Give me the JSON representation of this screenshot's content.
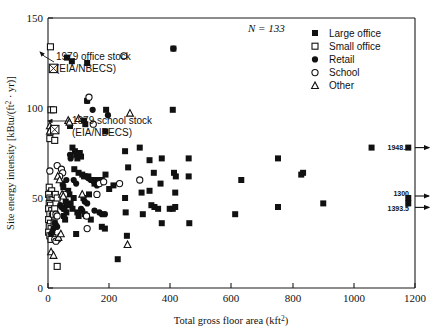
{
  "chart_data": {
    "type": "scatter",
    "title": "",
    "xlabel": "Total gross floor area (kft",
    "xlabel_sup": "2",
    "xlabel_tail": ")",
    "ylabel_a": "Site energy intensity [kBtu/(ft",
    "ylabel_sup": "2",
    "ylabel_b": " · yr)]",
    "xlim": [
      0,
      1200
    ],
    "ylim": [
      0,
      150
    ],
    "xticks": [
      0,
      200,
      400,
      600,
      800,
      1000,
      1200
    ],
    "yticks": [
      0,
      50,
      100,
      150
    ],
    "grid": false,
    "legend_position": "top-right",
    "n_label": "N = 133",
    "legend": [
      {
        "label": "Large office",
        "marker": "filled-square"
      },
      {
        "label": "Small office",
        "marker": "open-square"
      },
      {
        "label": "Retail",
        "marker": "filled-circle"
      },
      {
        "label": "School",
        "marker": "open-circle"
      },
      {
        "label": "Other",
        "marker": "open-triangle"
      }
    ],
    "annotations": [
      {
        "text_line1": "1979 office stock",
        "text_line2": "(EIA/NBECS)",
        "marker": "crossed-square",
        "point": [
          18,
          122
        ]
      },
      {
        "text_line1": "1979 school stock",
        "text_line2": "(EIA/NBECS)",
        "marker": "crossed-square",
        "point": [
          22,
          88
        ]
      }
    ],
    "offscale_labels": [
      {
        "value": "1948.2",
        "y": 78
      },
      {
        "value": "1300",
        "y": 50
      },
      {
        "value": "1393.5",
        "y": 47
      }
    ],
    "series": [
      {
        "name": "Large office",
        "marker": "filled-square",
        "points": [
          [
            62,
            128
          ],
          [
            78,
            126
          ],
          [
            128,
            125
          ],
          [
            410,
            133
          ],
          [
            128,
            104
          ],
          [
            190,
            99
          ],
          [
            408,
            99
          ],
          [
            72,
            90
          ],
          [
            118,
            93
          ],
          [
            122,
            91
          ],
          [
            188,
            87
          ],
          [
            80,
            78
          ],
          [
            88,
            76
          ],
          [
            92,
            74
          ],
          [
            96,
            72
          ],
          [
            104,
            75
          ],
          [
            108,
            73
          ],
          [
            252,
            76
          ],
          [
            300,
            78
          ],
          [
            332,
            71
          ],
          [
            372,
            72
          ],
          [
            460,
            72
          ],
          [
            86,
            66
          ],
          [
            100,
            64
          ],
          [
            112,
            63
          ],
          [
            118,
            62
          ],
          [
            132,
            62
          ],
          [
            156,
            59
          ],
          [
            162,
            60
          ],
          [
            188,
            63
          ],
          [
            262,
            67
          ],
          [
            346,
            64
          ],
          [
            412,
            64
          ],
          [
            418,
            62
          ],
          [
            460,
            62
          ],
          [
            332,
            54
          ],
          [
            368,
            58
          ],
          [
            416,
            53
          ],
          [
            306,
            53
          ],
          [
            252,
            50
          ],
          [
            134,
            52
          ],
          [
            116,
            50
          ],
          [
            84,
            50
          ],
          [
            74,
            47
          ],
          [
            80,
            44
          ],
          [
            96,
            42
          ],
          [
            100,
            40
          ],
          [
            120,
            41
          ],
          [
            126,
            40
          ],
          [
            140,
            38
          ],
          [
            176,
            34
          ],
          [
            186,
            33
          ],
          [
            254,
            42
          ],
          [
            310,
            41
          ],
          [
            338,
            46
          ],
          [
            348,
            45
          ],
          [
            360,
            44
          ],
          [
            398,
            44
          ],
          [
            408,
            44
          ],
          [
            416,
            45
          ],
          [
            372,
            36
          ],
          [
            462,
            36
          ],
          [
            258,
            29
          ],
          [
            92,
            30
          ],
          [
            228,
            16
          ],
          [
            612,
            41
          ],
          [
            632,
            60
          ],
          [
            752,
            45
          ],
          [
            752,
            72
          ],
          [
            828,
            63
          ],
          [
            834,
            64
          ],
          [
            900,
            47
          ],
          [
            1058,
            78
          ],
          [
            1178,
            78
          ],
          [
            1178,
            50
          ],
          [
            1178,
            47
          ],
          [
            66,
            54
          ],
          [
            70,
            52
          ],
          [
            58,
            48
          ],
          [
            62,
            46
          ],
          [
            54,
            44
          ],
          [
            60,
            42
          ],
          [
            52,
            40
          ],
          [
            56,
            38
          ],
          [
            48,
            58
          ],
          [
            50,
            56
          ],
          [
            148,
            60
          ],
          [
            152,
            58
          ],
          [
            176,
            60
          ],
          [
            200,
            55
          ],
          [
            214,
            57
          ]
        ]
      },
      {
        "name": "Small office",
        "marker": "open-square",
        "points": [
          [
            8,
            134
          ],
          [
            10,
            99
          ],
          [
            18,
            99
          ],
          [
            6,
            83
          ],
          [
            22,
            82
          ],
          [
            4,
            56
          ],
          [
            12,
            54
          ],
          [
            2,
            52
          ],
          [
            6,
            50
          ],
          [
            10,
            49
          ],
          [
            16,
            49
          ],
          [
            4,
            47
          ],
          [
            8,
            46
          ],
          [
            2,
            44
          ],
          [
            12,
            43
          ],
          [
            6,
            41
          ],
          [
            14,
            40
          ],
          [
            2,
            38
          ],
          [
            8,
            36
          ],
          [
            4,
            34
          ],
          [
            10,
            33
          ],
          [
            2,
            31
          ],
          [
            6,
            29
          ],
          [
            16,
            28
          ],
          [
            10,
            27
          ],
          [
            30,
            12
          ],
          [
            26,
            47
          ],
          [
            22,
            44
          ],
          [
            18,
            41
          ],
          [
            24,
            52
          ],
          [
            30,
            50
          ],
          [
            20,
            36
          ]
        ]
      },
      {
        "name": "Retail",
        "marker": "filled-circle",
        "points": [
          [
            410,
            133
          ],
          [
            128,
            104
          ],
          [
            146,
            99
          ],
          [
            196,
            96
          ],
          [
            72,
            74
          ],
          [
            74,
            72
          ],
          [
            126,
            62
          ],
          [
            132,
            61
          ],
          [
            140,
            60
          ],
          [
            146,
            60
          ],
          [
            150,
            59
          ],
          [
            156,
            58
          ],
          [
            160,
            57
          ],
          [
            164,
            58
          ],
          [
            120,
            48
          ],
          [
            128,
            47
          ],
          [
            108,
            44
          ],
          [
            112,
            43
          ],
          [
            152,
            43
          ],
          [
            168,
            42
          ],
          [
            176,
            41
          ],
          [
            186,
            41
          ],
          [
            22,
            36
          ],
          [
            26,
            35
          ],
          [
            30,
            34
          ],
          [
            18,
            33
          ],
          [
            14,
            31
          ],
          [
            10,
            30
          ],
          [
            34,
            27
          ],
          [
            40,
            46
          ],
          [
            44,
            45
          ],
          [
            50,
            44
          ],
          [
            60,
            60
          ],
          [
            84,
            60
          ],
          [
            92,
            58
          ]
        ]
      },
      {
        "name": "School",
        "marker": "open-circle",
        "points": [
          [
            248,
            129
          ],
          [
            134,
            106
          ],
          [
            148,
            91
          ],
          [
            6,
            65
          ],
          [
            30,
            68
          ],
          [
            44,
            66
          ],
          [
            48,
            64
          ],
          [
            38,
            62
          ],
          [
            168,
            58
          ],
          [
            182,
            59
          ],
          [
            234,
            58
          ],
          [
            300,
            60
          ],
          [
            26,
            41
          ],
          [
            30,
            40
          ],
          [
            126,
            40
          ],
          [
            128,
            33
          ],
          [
            160,
            52
          ],
          [
            54,
            52
          ],
          [
            22,
            27
          ],
          [
            26,
            26
          ]
        ]
      },
      {
        "name": "Other",
        "marker": "open-triangle",
        "points": [
          [
            268,
            97
          ],
          [
            66,
            93
          ],
          [
            70,
            92
          ],
          [
            100,
            94
          ],
          [
            6,
            90
          ],
          [
            10,
            88
          ],
          [
            32,
            62
          ],
          [
            38,
            60
          ],
          [
            46,
            52
          ],
          [
            50,
            51
          ],
          [
            112,
            52
          ],
          [
            6,
            87
          ],
          [
            260,
            24
          ],
          [
            10,
            20
          ],
          [
            18,
            18
          ],
          [
            34,
            28
          ],
          [
            42,
            30
          ]
        ]
      }
    ]
  }
}
